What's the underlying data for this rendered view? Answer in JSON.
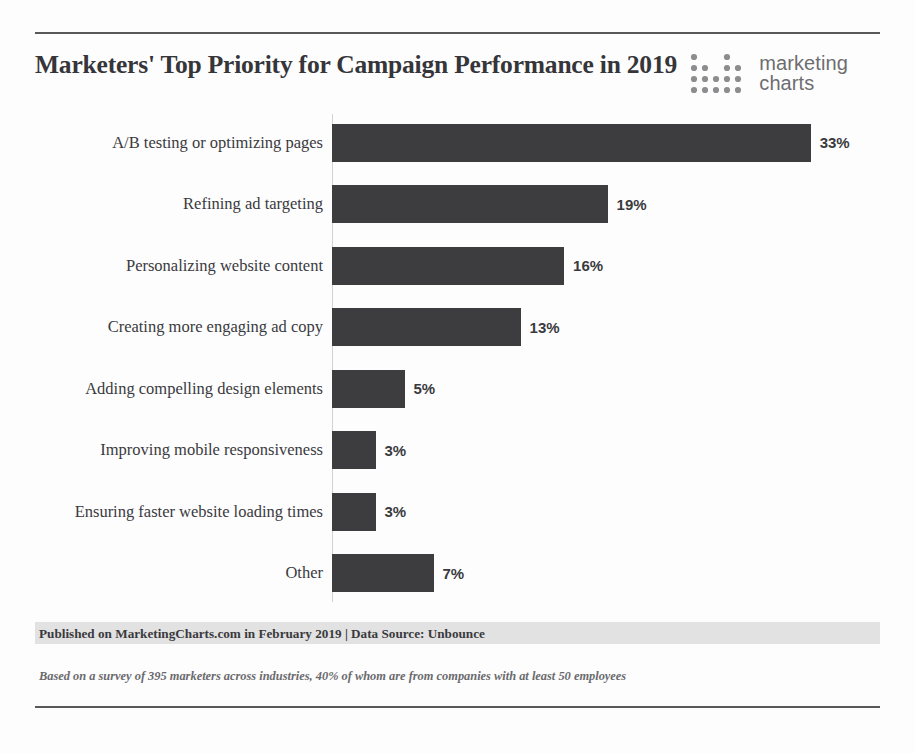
{
  "header": {
    "title": "Marketers' Top Priority for Campaign Performance in 2019",
    "logo": {
      "line1": "marketing",
      "line2": "charts",
      "icon": "dot-matrix-icon"
    }
  },
  "footer": {
    "attribution": "Published on MarketingCharts.com in February 2019 | Data Source: Unbounce",
    "note": "Based on a survey of 395 marketers across industries, 40% of whom are from companies with at least 50 employees"
  },
  "colors": {
    "bar": "#3d3d40",
    "text": "#3a3a3e",
    "rule": "#59595c",
    "band": "#e2e2e2",
    "logo_text": "#6d6d70",
    "axis": "#d2d2d4"
  },
  "chart_data": {
    "type": "bar",
    "orientation": "horizontal",
    "title": "Marketers' Top Priority for Campaign Performance in 2019",
    "xlabel": "",
    "ylabel": "",
    "xlim": [
      0,
      36
    ],
    "grid": false,
    "legend": false,
    "value_suffix": "%",
    "categories": [
      "A/B testing or optimizing pages",
      "Refining ad targeting",
      "Personalizing website content",
      "Creating more engaging ad copy",
      "Adding compelling design elements",
      "Improving mobile responsiveness",
      "Ensuring faster website loading times",
      "Other"
    ],
    "values": [
      33,
      19,
      16,
      13,
      5,
      3,
      3,
      7
    ],
    "labels": [
      "33%",
      "19%",
      "16%",
      "13%",
      "5%",
      "3%",
      "3%",
      "7%"
    ]
  }
}
